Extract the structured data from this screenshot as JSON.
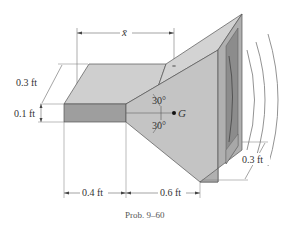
{
  "figure": {
    "caption": "Prob. 9–60",
    "centroid_label": "G",
    "centroid_distance_label": "x̄",
    "dimensions": {
      "prism_depth": "0.3 ft",
      "prism_height": "0.1 ft",
      "prism_length": "0.4 ft",
      "horn_length": "0.6 ft",
      "mouth_depth": "0.3 ft"
    },
    "angles": {
      "upper": "30°",
      "lower": "30°"
    },
    "colors": {
      "face_light": "#c9c9c9",
      "face_mid": "#b5b5b5",
      "face_dark": "#9a9a9a",
      "face_top": "#cfcfcf",
      "interior": "#8c8c8c",
      "line": "#555555",
      "dim_line": "#666666"
    }
  }
}
